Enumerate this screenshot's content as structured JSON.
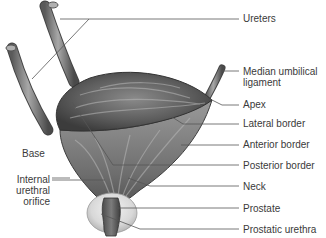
{
  "figure": {
    "labels_right": [
      {
        "id": "ureters",
        "text": "Ureters",
        "x": 242,
        "y": 12
      },
      {
        "id": "median-umbilical-ligament",
        "text": "Median umbilical",
        "text2": "ligament",
        "x": 243,
        "y": 66
      },
      {
        "id": "apex",
        "text": "Apex",
        "x": 243,
        "y": 99
      },
      {
        "id": "lateral-border",
        "text": "Lateral border",
        "x": 243,
        "y": 118
      },
      {
        "id": "anterior-border",
        "text": "Anterior border",
        "x": 243,
        "y": 139
      },
      {
        "id": "posterior-border",
        "text": "Posterior border",
        "x": 243,
        "y": 160
      },
      {
        "id": "neck",
        "text": "Neck",
        "x": 243,
        "y": 181
      },
      {
        "id": "prostate",
        "text": "Prostate",
        "x": 243,
        "y": 203
      },
      {
        "id": "prostatic-urethra",
        "text": "Prostatic urethra",
        "x": 243,
        "y": 224
      }
    ],
    "labels_left": [
      {
        "id": "base",
        "text": "Base",
        "x": 22,
        "y": 176
      },
      {
        "id": "internal-urethral-orifice",
        "text": "Internal",
        "text2": "urethral",
        "text3": "orifice",
        "x": 12,
        "y": 174
      }
    ]
  }
}
